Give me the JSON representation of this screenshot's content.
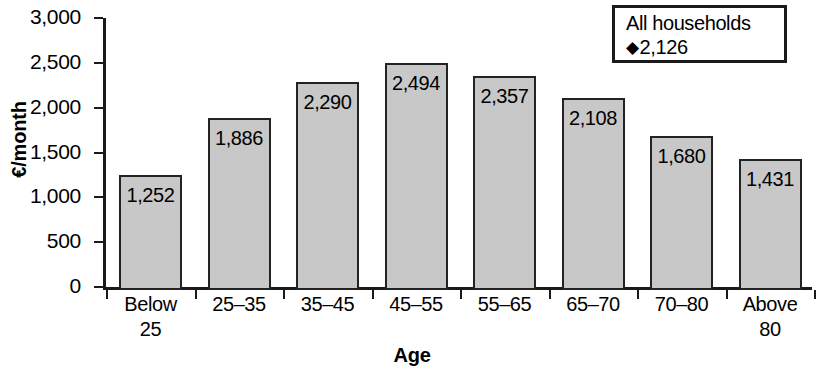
{
  "chart_data": {
    "type": "bar",
    "title": "",
    "xlabel": "Age",
    "ylabel": "€/month",
    "categories": [
      "Below\n25",
      "25–35",
      "35–45",
      "45–55",
      "55–65",
      "65–70",
      "70–80",
      "Above\n80"
    ],
    "values": [
      1252,
      1886,
      2290,
      2494,
      2357,
      2108,
      1680,
      1431
    ],
    "value_labels": [
      "1,252",
      "1,886",
      "2,290",
      "2,494",
      "2,357",
      "2,108",
      "1,680",
      "1,431"
    ],
    "ylim": [
      0,
      3000
    ],
    "ytick_values": [
      0,
      500,
      1000,
      1500,
      2000,
      2500,
      3000
    ],
    "ytick_labels": [
      "0",
      "500",
      "1,000",
      "1,500",
      "2,000",
      "2,500",
      "3,000"
    ],
    "grid": false,
    "legend_position": "top-right",
    "bar_color": "#c8c8c8",
    "bar_border_color": "#232323",
    "axis_color": "#1a1a1a",
    "reference": {
      "label": "All households",
      "marker": "◆",
      "value": 2126,
      "value_label": "2,126"
    }
  },
  "legend": {
    "title": "All households",
    "marker": "◆",
    "value_label": "2,126"
  },
  "axes": {
    "y_title": "€/month",
    "x_title": "Age"
  }
}
